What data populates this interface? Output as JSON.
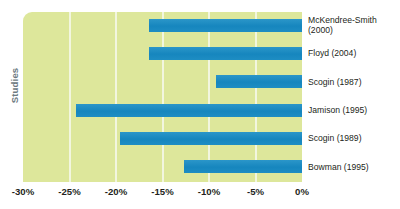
{
  "chart_data": {
    "type": "bar",
    "orientation": "horizontal",
    "title": "",
    "xlabel": "",
    "ylabel": "Studies",
    "xlim": [
      -30,
      0
    ],
    "xticks": [
      -30,
      -25,
      -20,
      -15,
      -10,
      -5,
      0
    ],
    "xtick_labels": [
      "-30%",
      "-25%",
      "-20%",
      "-15%",
      "-10%",
      "-5%",
      "0%"
    ],
    "grid": true,
    "legend": false,
    "categories": [
      "McKendree-Smith\n(2000)",
      "Floyd (2004)",
      "Scogin (1987)",
      "Jamison (1995)",
      "Scogin (1989)",
      "Bowman (1995)"
    ],
    "values": [
      -16.5,
      -16.5,
      -9.2,
      -24.3,
      -19.6,
      -12.7
    ],
    "bar_end": 0,
    "colors": {
      "bar": "#1d8ec4",
      "plot_background": "#dde79b",
      "gridline": "#f2f6df",
      "axis_text": "#231f20",
      "axis_title": "#6d7a81",
      "page_background": "#ffffff"
    }
  }
}
